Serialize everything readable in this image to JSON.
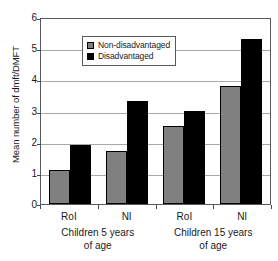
{
  "chart_data": {
    "type": "bar",
    "title": "",
    "xlabel": "",
    "ylabel": "Mean number of dmft/DMFT",
    "ylim": [
      0,
      6
    ],
    "yticks": [
      0,
      1,
      2,
      3,
      4,
      5,
      6
    ],
    "grid": true,
    "legend_position": "top-left inside plot",
    "categories": [
      "RoI",
      "NI",
      "RoI",
      "NI"
    ],
    "group_labels": [
      {
        "line1": "Children 5 years",
        "line2": "of age",
        "spans": [
          "RoI",
          "NI"
        ]
      },
      {
        "line1": "Children 15 years",
        "line2": "of age",
        "spans": [
          "RoI",
          "NI"
        ]
      }
    ],
    "series": [
      {
        "name": "Non-disadvantaged",
        "color": "#808080",
        "values": [
          1.1,
          1.7,
          2.5,
          3.8
        ]
      },
      {
        "name": "Disadvantaged",
        "color": "#000000",
        "values": [
          1.9,
          3.3,
          3.0,
          5.3
        ]
      }
    ]
  },
  "legend": {
    "entries": [
      {
        "label": "Non-disadvantaged"
      },
      {
        "label": "Disadvantaged"
      }
    ]
  }
}
